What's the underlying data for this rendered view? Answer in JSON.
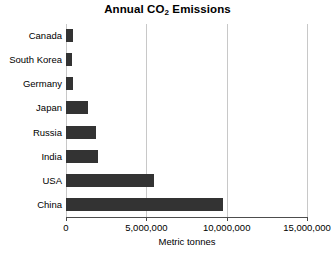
{
  "chart_data": {
    "type": "bar",
    "orientation": "horizontal",
    "title": "Annual CO2 Emissions",
    "title_main": "Annual CO",
    "title_subscript": "2",
    "title_tail": " Emissions",
    "xlabel": "Metric tonnes",
    "ylabel": "",
    "xlim": [
      0,
      15000000
    ],
    "grid": "vertical",
    "legend": "none",
    "bar_color": "#333333",
    "gridline_color": "#c8c8c8",
    "axis_color": "#4d4d4d",
    "categories": [
      "Canada",
      "South Korea",
      "Germany",
      "Japan",
      "Russia",
      "India",
      "USA",
      "China"
    ],
    "values": [
      456000,
      375000,
      440000,
      1380000,
      1880000,
      2000000,
      5500000,
      9750000
    ],
    "xticks": [
      0,
      5000000,
      10000000,
      15000000
    ],
    "xticklabels": [
      "0",
      "5,000,000",
      "10,000,000",
      "15,000,000"
    ]
  }
}
